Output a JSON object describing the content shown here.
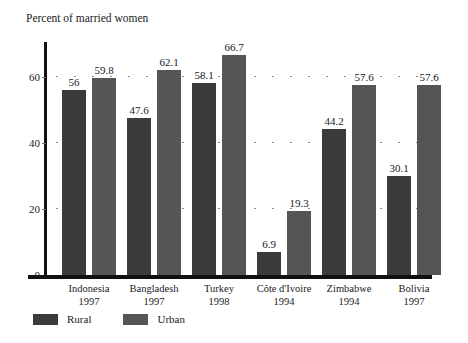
{
  "chart_data": {
    "type": "bar",
    "title": "Percent of married women",
    "xlabel": "",
    "ylabel": "",
    "ylim": [
      0,
      70
    ],
    "yticks": [
      0,
      20,
      40,
      60
    ],
    "grid": "dotted-horizontal",
    "grid_at": [
      20,
      40,
      60
    ],
    "legend_position": "bottom-left",
    "categories": [
      "Indonesia",
      "Bangladesh",
      "Turkey",
      "Côte d'Ivoire",
      "Zimbabwe",
      "Bolivia"
    ],
    "category_years": [
      "1997",
      "1997",
      "1998",
      "1994",
      "1994",
      "1997"
    ],
    "series": [
      {
        "name": "Rural",
        "color": "#3b3b3b",
        "values": [
          56,
          47.6,
          58.1,
          6.9,
          44.2,
          30.1
        ],
        "labels": [
          "56",
          "47.6",
          "58.1",
          "6.9",
          "44.2",
          "30.1"
        ]
      },
      {
        "name": "Urban",
        "color": "#555555",
        "values": [
          59.8,
          62.1,
          66.7,
          19.3,
          57.6,
          57.6
        ],
        "labels": [
          "59.8",
          "62.1",
          "66.7",
          "19.3",
          "57.6",
          "57.6"
        ]
      }
    ]
  },
  "axis": {
    "tick_labels": [
      "0",
      "20",
      "40",
      "60"
    ]
  },
  "legend": {
    "items": [
      {
        "label": "Rural",
        "color": "#3b3b3b"
      },
      {
        "label": "Urban",
        "color": "#555555"
      }
    ]
  }
}
